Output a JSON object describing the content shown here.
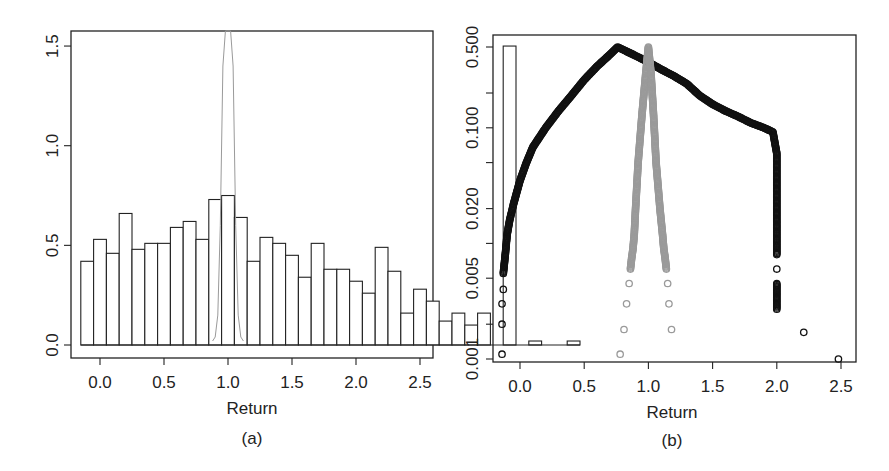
{
  "chart_data": [
    {
      "panel": "(a)",
      "type": "bar",
      "subtype": "histogram",
      "title": "",
      "xlabel": "Return",
      "ylabel": "",
      "caption": "(a)",
      "xlim": [
        -0.25,
        2.6
      ],
      "ylim": [
        0,
        1.6
      ],
      "xticks": [
        "0.0",
        "0.5",
        "1.0",
        "1.5",
        "2.0",
        "2.5"
      ],
      "yticks": [
        "0.0",
        "0.5",
        "1.0",
        "1.5"
      ],
      "bin_width": 0.1,
      "bin_start": -0.15,
      "values": [
        0.42,
        0.53,
        0.46,
        0.66,
        0.48,
        0.51,
        0.51,
        0.59,
        0.62,
        0.53,
        0.73,
        0.75,
        0.64,
        0.42,
        0.54,
        0.51,
        0.45,
        0.34,
        0.51,
        0.38,
        0.38,
        0.32,
        0.26,
        0.49,
        0.37,
        0.16,
        0.28,
        0.22,
        0.12,
        0.16,
        0.1,
        0.16,
        0,
        1.5,
        0,
        0.02,
        0,
        0,
        0.02
      ],
      "overlay": {
        "type": "line",
        "color": "#9a9a9a",
        "description": "narrow density peak centered near 1.0, extending beyond the top of the plot",
        "x": [
          0.88,
          0.9,
          0.92,
          0.94,
          0.96,
          0.98,
          1.0,
          1.02,
          1.04,
          1.06,
          1.08,
          1.1,
          1.12
        ],
        "y": [
          0.02,
          0.04,
          0.15,
          0.6,
          1.4,
          2.5,
          3.0,
          2.5,
          1.4,
          0.6,
          0.15,
          0.04,
          0.02
        ]
      },
      "grid": false,
      "legend": null
    },
    {
      "panel": "(b)",
      "type": "scatter",
      "title": "",
      "xlabel": "Return",
      "ylabel": "",
      "caption": "(b)",
      "yscale": "log",
      "xlim": [
        -0.25,
        2.6
      ],
      "ylim": [
        0.001,
        0.55
      ],
      "xticks": [
        "0.0",
        "0.5",
        "1.0",
        "1.5",
        "2.0",
        "2.5"
      ],
      "yticks": [
        "0.001",
        "0.005",
        "0.020",
        "0.100",
        "0.500"
      ],
      "yticks_minor": [
        0.002,
        0.01,
        0.05,
        0.2
      ],
      "series": [
        {
          "name": "empirical (black)",
          "color": "#111111",
          "x": [
            -0.14,
            -0.14,
            -0.14,
            -0.13,
            -0.13,
            -0.12,
            -0.11,
            -0.1,
            -0.08,
            -0.05,
            0.0,
            0.05,
            0.1,
            0.2,
            0.3,
            0.4,
            0.5,
            0.6,
            0.7,
            0.76,
            0.9,
            1.0,
            1.1,
            1.2,
            1.3,
            1.4,
            1.5,
            1.6,
            1.7,
            1.8,
            1.9,
            1.97,
            2.0,
            2.0,
            2.0,
            2.0,
            2.0,
            2.0,
            2.0,
            2.0,
            2.21,
            2.48
          ],
          "y": [
            0.0011,
            0.002,
            0.003,
            0.004,
            0.0055,
            0.007,
            0.009,
            0.012,
            0.016,
            0.022,
            0.035,
            0.05,
            0.068,
            0.1,
            0.14,
            0.19,
            0.26,
            0.34,
            0.43,
            0.5,
            0.42,
            0.37,
            0.32,
            0.28,
            0.24,
            0.19,
            0.16,
            0.14,
            0.125,
            0.11,
            0.1,
            0.092,
            0.06,
            0.03,
            0.015,
            0.008,
            0.006,
            0.0045,
            0.0035,
            0.0027,
            0.0017,
            0.001
          ]
        },
        {
          "name": "model (gray)",
          "color": "#9a9a9a",
          "x": [
            0.78,
            0.81,
            0.83,
            0.85,
            0.86,
            0.87,
            0.88,
            0.89,
            0.9,
            0.92,
            0.95,
            0.98,
            1.0,
            1.02,
            1.04,
            1.06,
            1.09,
            1.11,
            1.12,
            1.13,
            1.14,
            1.15,
            1.16,
            1.18
          ],
          "y": [
            0.0011,
            0.0018,
            0.003,
            0.0045,
            0.006,
            0.0075,
            0.009,
            0.012,
            0.02,
            0.05,
            0.13,
            0.3,
            0.5,
            0.3,
            0.13,
            0.05,
            0.02,
            0.012,
            0.009,
            0.0075,
            0.006,
            0.0045,
            0.003,
            0.0018
          ]
        }
      ],
      "grid": false,
      "legend": null
    }
  ]
}
